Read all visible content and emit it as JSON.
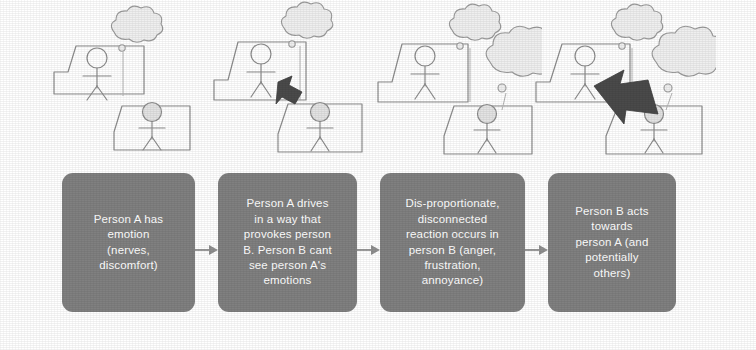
{
  "diagram": {
    "background_color": "#ffffff",
    "box_color": "#808080",
    "box_text_color": "#ffffff",
    "sketch_line_color": "#8c8c8c",
    "arrow_dark_color": "#4a4a4a",
    "connector_color": "#9a9a9a",
    "cloud_fill_color": "#efefef",
    "head_fill_color": "#e3e3e3"
  },
  "illustrations": [
    {
      "name": "panel-1",
      "caption_ref": "step-1",
      "person_a_cloud": "small",
      "person_b_cloud": "none",
      "arrow": "none"
    },
    {
      "name": "panel-2",
      "caption_ref": "step-2",
      "person_a_cloud": "small",
      "person_b_cloud": "none",
      "arrow": "a-to-b"
    },
    {
      "name": "panel-3",
      "caption_ref": "step-3",
      "person_a_cloud": "small",
      "person_b_cloud": "large",
      "arrow": "none"
    },
    {
      "name": "panel-4",
      "caption_ref": "step-4",
      "person_a_cloud": "small",
      "person_b_cloud": "large",
      "arrow": "b-to-a"
    }
  ],
  "flow": {
    "steps": [
      {
        "id": "step-1",
        "text": "Person A has\nemotion\n(nerves,\ndiscomfort)"
      },
      {
        "id": "step-2",
        "text": "Person A drives\nin a way that\nprovokes person\nB. Person B cant\nsee person A's\nemotions"
      },
      {
        "id": "step-3",
        "text": "Dis-proportionate,\ndisconnected\nreaction occurs in\nperson B (anger,\nfrustration,\nannoyance)"
      },
      {
        "id": "step-4",
        "text": "Person B acts\ntowards\nperson A (and\npotentially\nothers)"
      }
    ],
    "connectors": [
      {
        "id": "connector-1-2",
        "from": "step-1",
        "to": "step-2"
      },
      {
        "id": "connector-2-3",
        "from": "step-2",
        "to": "step-3"
      },
      {
        "id": "connector-3-4",
        "from": "step-3",
        "to": "step-4"
      }
    ]
  }
}
